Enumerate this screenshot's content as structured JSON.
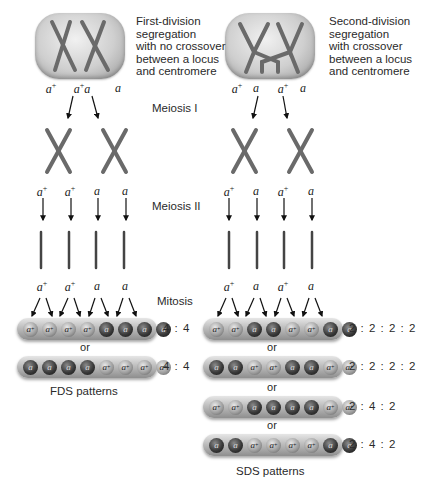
{
  "left_panel": {
    "description": [
      "First-division",
      "segregation",
      "with no crossover",
      "between a locus",
      "and centromere"
    ],
    "meiosis1_alleles": [
      "a+",
      "a+a",
      "a"
    ],
    "meiosis2_alleles": [
      "a+",
      "a+",
      "a",
      "a"
    ],
    "mitosis_alleles": [
      "a+",
      "a+",
      "a",
      "a"
    ],
    "asci": [
      {
        "spores": [
          "a+",
          "a+",
          "a+",
          "a+",
          "a",
          "a",
          "a",
          "a"
        ],
        "ratio": "4 : 4"
      },
      {
        "spores": [
          "a",
          "a",
          "a",
          "a",
          "a+",
          "a+",
          "a+",
          "a+"
        ],
        "ratio": "4 : 4"
      }
    ],
    "or_label": "or",
    "pattern_label": "FDS patterns"
  },
  "right_panel": {
    "description": [
      "Second-division",
      "segregation",
      "with crossover",
      "between a locus",
      "and centromere"
    ],
    "meiosis1_alleles": [
      "a+",
      "a",
      "a+",
      "a"
    ],
    "meiosis2_alleles": [
      "a+",
      "a",
      "a+",
      "a"
    ],
    "mitosis_alleles": [
      "a+",
      "a",
      "a+",
      "a"
    ],
    "asci": [
      {
        "spores": [
          "a+",
          "a+",
          "a",
          "a",
          "a+",
          "a+",
          "a",
          "a"
        ],
        "ratio": "2 : 2 : 2 : 2"
      },
      {
        "spores": [
          "a",
          "a",
          "a+",
          "a+",
          "a",
          "a",
          "a+",
          "a+"
        ],
        "ratio": "2 : 2 : 2 : 2"
      },
      {
        "spores": [
          "a+",
          "a+",
          "a",
          "a",
          "a",
          "a",
          "a+",
          "a+"
        ],
        "ratio": "2 : 4 : 2"
      },
      {
        "spores": [
          "a",
          "a",
          "a+",
          "a+",
          "a+",
          "a+",
          "a",
          "a"
        ],
        "ratio": "2 : 4 : 2"
      }
    ],
    "or_label": "or",
    "pattern_label": "SDS patterns"
  },
  "stages": {
    "meiosis1": "Meiosis I",
    "meiosis2": "Meiosis II",
    "mitosis": "Mitosis"
  },
  "colors": {
    "dark_spore": "#1e1e1e",
    "light_spore": "#a0a0a0",
    "cell_gray": "#c8c8c8",
    "chromosome": "#6e6e6e"
  }
}
